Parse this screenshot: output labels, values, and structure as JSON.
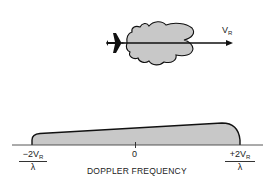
{
  "diagram": {
    "top": {
      "aircraft": "airplane-icon",
      "antenna_pattern": "radar-lobe-pattern",
      "velocity_vector": {
        "symbol": "V",
        "subscript": "R"
      }
    },
    "spectrum": {
      "axis_label": "DOPPLER FREQUENCY",
      "ticks": {
        "left": {
          "numerator_prefix": "−2V",
          "subscript": "R",
          "denominator": "λ"
        },
        "center": "0",
        "right": {
          "numerator_prefix": "+2V",
          "subscript": "R",
          "denominator": "λ"
        }
      }
    },
    "colors": {
      "fill": "#c8c8c8",
      "stroke": "#111111",
      "axis": "#444444"
    }
  }
}
